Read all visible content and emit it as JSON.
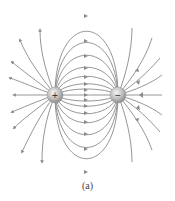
{
  "figure": {
    "caption": "(a)",
    "positive_charge": {
      "symbol": "+",
      "x": 55,
      "y": 95
    },
    "negative_charge": {
      "symbol": "−",
      "x": 118,
      "y": 95
    },
    "line_color": "#8a8a8a",
    "charge_color": "#b8b8b8"
  }
}
